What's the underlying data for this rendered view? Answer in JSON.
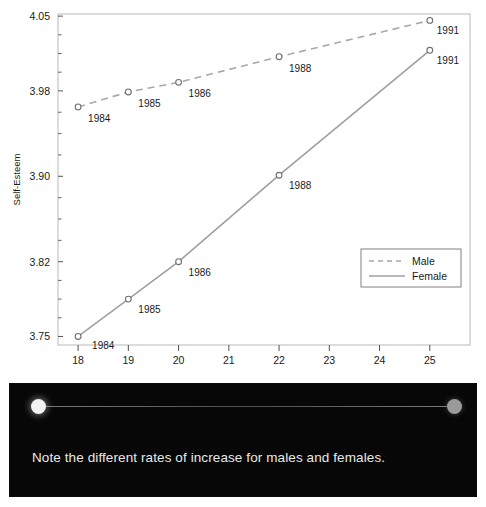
{
  "chart_data": {
    "type": "line",
    "title": "",
    "xlabel": "Age",
    "ylabel": "Self-Esteem",
    "xlim": [
      17.6,
      25.8
    ],
    "ylim": [
      3.742,
      4.052
    ],
    "grid": false,
    "legend_position": "bottom-right",
    "x_ticks": [
      "18",
      "19",
      "20",
      "21",
      "22",
      "23",
      "24",
      "25"
    ],
    "x_tick_values": [
      18,
      19,
      20,
      21,
      22,
      23,
      24,
      25
    ],
    "y_ticks": [
      "3.75",
      "3.82",
      "3.90",
      "3.98",
      "4.05"
    ],
    "y_tick_values": [
      3.75,
      3.82,
      3.9,
      3.98,
      4.05
    ],
    "series": [
      {
        "name": "Male",
        "style": "dashed",
        "color": "#a8a8a8",
        "marker": "open-circle",
        "x": [
          18,
          19,
          20,
          22,
          25
        ],
        "values": [
          3.965,
          3.979,
          3.988,
          4.012,
          4.046
        ],
        "point_labels": [
          "1984",
          "1985",
          "1986",
          "1988",
          "1991"
        ]
      },
      {
        "name": "Female",
        "style": "solid",
        "color": "#a0a0a0",
        "marker": "open-circle",
        "x": [
          18,
          19,
          20,
          22,
          25
        ],
        "values": [
          3.75,
          3.785,
          3.82,
          3.901,
          4.018
        ],
        "point_labels": [
          "1984",
          "1985",
          "1986",
          "1988",
          "1991"
        ]
      }
    ],
    "legend": [
      {
        "label": "Male",
        "style": "dashed"
      },
      {
        "label": "Female",
        "style": "solid"
      }
    ]
  },
  "panel": {
    "caption": "Note the different rates of increase for males and females.",
    "slider": {
      "left_handle_name": "start-handle",
      "right_handle_name": "end-handle"
    }
  },
  "colors": {
    "frame": "#b9b9b9",
    "male": "#a8a8a8",
    "female": "#a0a0a0",
    "text": "#1a1a1a",
    "panel_bg": "#070707",
    "caption": "#e8e8e8"
  }
}
